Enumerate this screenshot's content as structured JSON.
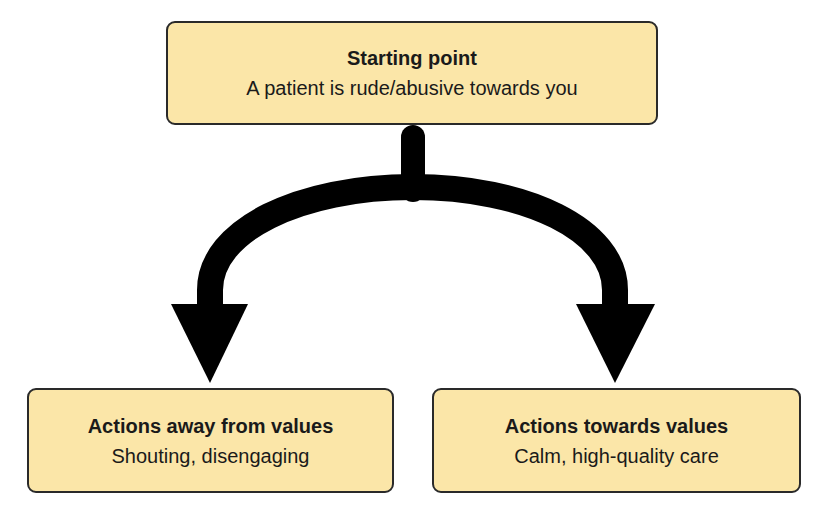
{
  "diagram": {
    "type": "branching-flow",
    "nodes": [
      {
        "id": "start",
        "title": "Starting point",
        "description": "A patient is rude/abusive towards you"
      },
      {
        "id": "away",
        "title": "Actions away from values",
        "description": "Shouting, disengaging"
      },
      {
        "id": "towards",
        "title": "Actions towards values",
        "description": "Calm, high-quality care"
      }
    ],
    "edges": [
      {
        "from": "start",
        "to": "away"
      },
      {
        "from": "start",
        "to": "towards"
      }
    ],
    "colors": {
      "box_fill": "#fbe6a8",
      "box_border": "#2a2a2a",
      "arrow": "#000000"
    }
  }
}
